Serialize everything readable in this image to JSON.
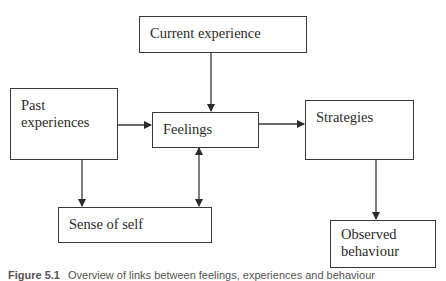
{
  "diagram": {
    "nodes": [
      {
        "id": "current_experience",
        "label": "Current experience"
      },
      {
        "id": "past_experiences",
        "label": "Past experiences",
        "lines": [
          "Past",
          "experiences"
        ]
      },
      {
        "id": "feelings",
        "label": "Feelings"
      },
      {
        "id": "strategies",
        "label": "Strategies"
      },
      {
        "id": "sense_of_self",
        "label": "Sense of self"
      },
      {
        "id": "observed_behaviour",
        "label": "Observed behaviour",
        "lines": [
          "Observed",
          "behaviour"
        ]
      }
    ],
    "edges": [
      {
        "from": "current_experience",
        "to": "feelings",
        "direction": "forward"
      },
      {
        "from": "past_experiences",
        "to": "feelings",
        "direction": "forward"
      },
      {
        "from": "past_experiences",
        "to": "sense_of_self",
        "direction": "forward"
      },
      {
        "from": "feelings",
        "to": "strategies",
        "direction": "forward"
      },
      {
        "from": "feelings",
        "to": "sense_of_self",
        "direction": "bidirectional"
      },
      {
        "from": "strategies",
        "to": "observed_behaviour",
        "direction": "forward"
      }
    ],
    "colors": {
      "stroke": "#3a3a3a",
      "background": "#ffffff",
      "text": "#2a2a2a"
    }
  },
  "caption": {
    "figure_label": "Figure 5.1",
    "text": "Overview of links between feelings, experiences and behaviour"
  }
}
